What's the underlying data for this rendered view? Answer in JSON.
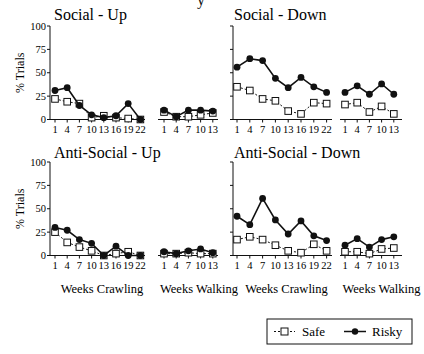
{
  "figure": {
    "top_fragment": "y",
    "ylabel": "% Trials",
    "yticks": [
      "0",
      "25",
      "50",
      "75",
      "100"
    ],
    "xticks_crawling": [
      "1",
      "4",
      "7",
      "10",
      "13",
      "16",
      "19",
      "22"
    ],
    "xticks_walking": [
      "1",
      "4",
      "7",
      "10",
      "13"
    ],
    "xlabel_crawling": "Weeks Crawling",
    "xlabel_walking": "Weeks Walking",
    "legend": {
      "safe": "Safe",
      "risky": "Risky"
    }
  },
  "chart_data": [
    {
      "type": "line",
      "title": "Social - Up",
      "ylabel": "% Trials",
      "ylim": [
        0,
        100
      ],
      "grid": false,
      "legend_position": "bottom-right (shared)",
      "segments": [
        {
          "xlabel": "Weeks Crawling",
          "x": [
            1,
            4,
            7,
            10,
            13,
            16,
            19,
            22
          ],
          "series": [
            {
              "name": "Safe",
              "marker": "open-square",
              "line": "dashed",
              "values": [
                22,
                19,
                17,
                2,
                4,
                2,
                1,
                0
              ]
            },
            {
              "name": "Risky",
              "marker": "filled-circle",
              "line": "solid",
              "values": [
                31,
                34,
                15,
                5,
                2,
                4,
                17,
                0
              ]
            }
          ]
        },
        {
          "xlabel": "Weeks Walking",
          "x": [
            1,
            4,
            7,
            10,
            13
          ],
          "series": [
            {
              "name": "Safe",
              "marker": "open-square",
              "line": "dashed",
              "values": [
                8,
                3,
                3,
                5,
                7
              ]
            },
            {
              "name": "Risky",
              "marker": "filled-circle",
              "line": "solid",
              "values": [
                10,
                3,
                10,
                10,
                9
              ]
            }
          ]
        }
      ]
    },
    {
      "type": "line",
      "title": "Social - Down",
      "ylabel": "% Trials",
      "ylim": [
        0,
        100
      ],
      "grid": false,
      "segments": [
        {
          "xlabel": "Weeks Crawling",
          "x": [
            1,
            4,
            7,
            10,
            13,
            16,
            19,
            22
          ],
          "series": [
            {
              "name": "Safe",
              "marker": "open-square",
              "line": "dashed",
              "values": [
                35,
                31,
                22,
                20,
                9,
                6,
                18,
                17
              ]
            },
            {
              "name": "Risky",
              "marker": "filled-circle",
              "line": "solid",
              "values": [
                56,
                65,
                63,
                44,
                34,
                45,
                35,
                29
              ]
            }
          ]
        },
        {
          "xlabel": "Weeks Walking",
          "x": [
            1,
            4,
            7,
            10,
            13
          ],
          "series": [
            {
              "name": "Safe",
              "marker": "open-square",
              "line": "dashed",
              "values": [
                16,
                18,
                8,
                14,
                6
              ]
            },
            {
              "name": "Risky",
              "marker": "filled-circle",
              "line": "solid",
              "values": [
                29,
                36,
                27,
                38,
                27
              ]
            }
          ]
        }
      ]
    },
    {
      "type": "line",
      "title": "Anti-Social - Up",
      "ylabel": "% Trials",
      "ylim": [
        0,
        100
      ],
      "grid": false,
      "segments": [
        {
          "xlabel": "Weeks Crawling",
          "x": [
            1,
            4,
            7,
            10,
            13,
            16,
            19,
            22
          ],
          "series": [
            {
              "name": "Safe",
              "marker": "open-square",
              "line": "dashed",
              "values": [
                25,
                14,
                9,
                5,
                0,
                2,
                4,
                0
              ]
            },
            {
              "name": "Risky",
              "marker": "filled-circle",
              "line": "solid",
              "values": [
                30,
                27,
                17,
                13,
                0,
                10,
                0,
                0
              ]
            }
          ]
        },
        {
          "xlabel": "Weeks Walking",
          "x": [
            1,
            4,
            7,
            10,
            13
          ],
          "series": [
            {
              "name": "Safe",
              "marker": "open-square",
              "line": "dashed",
              "values": [
                2,
                2,
                3,
                2,
                2
              ]
            },
            {
              "name": "Risky",
              "marker": "filled-circle",
              "line": "solid",
              "values": [
                4,
                2,
                5,
                7,
                3
              ]
            }
          ]
        }
      ]
    },
    {
      "type": "line",
      "title": "Anti-Social - Down",
      "ylabel": "% Trials",
      "ylim": [
        0,
        100
      ],
      "grid": false,
      "segments": [
        {
          "xlabel": "Weeks Crawling",
          "x": [
            1,
            4,
            7,
            10,
            13,
            16,
            19,
            22
          ],
          "series": [
            {
              "name": "Safe",
              "marker": "open-square",
              "line": "dashed",
              "values": [
                17,
                20,
                17,
                11,
                5,
                3,
                12,
                5
              ]
            },
            {
              "name": "Risky",
              "marker": "filled-circle",
              "line": "solid",
              "values": [
                42,
                33,
                61,
                38,
                23,
                37,
                21,
                16
              ]
            }
          ]
        },
        {
          "xlabel": "Weeks Walking",
          "x": [
            1,
            4,
            7,
            10,
            13
          ],
          "series": [
            {
              "name": "Safe",
              "marker": "open-square",
              "line": "dashed",
              "values": [
                4,
                4,
                2,
                7,
                8
              ]
            },
            {
              "name": "Risky",
              "marker": "filled-circle",
              "line": "solid",
              "values": [
                11,
                18,
                9,
                17,
                20
              ]
            }
          ]
        }
      ]
    }
  ]
}
